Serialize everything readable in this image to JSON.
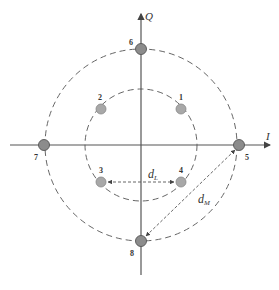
{
  "diagram": {
    "type": "8-QAM star constellation",
    "center": [
      141,
      145
    ],
    "axes": {
      "i_label": "I",
      "q_label": "Q"
    },
    "circles": [
      {
        "name": "inner-ring",
        "radius": 56
      },
      {
        "name": "outer-ring",
        "radius": 96
      }
    ],
    "points": [
      {
        "id": "1",
        "label": "1",
        "x": 181,
        "y": 109,
        "ring": "inner"
      },
      {
        "id": "2",
        "label": "2",
        "x": 101,
        "y": 109,
        "ring": "inner"
      },
      {
        "id": "3",
        "label": "3",
        "x": 101,
        "y": 182,
        "ring": "inner"
      },
      {
        "id": "4",
        "label": "4",
        "x": 181,
        "y": 182,
        "ring": "inner"
      },
      {
        "id": "5",
        "label": "5",
        "x": 239,
        "y": 145,
        "ring": "outer"
      },
      {
        "id": "6",
        "label": "6",
        "x": 141,
        "y": 49,
        "ring": "outer"
      },
      {
        "id": "7",
        "label": "7",
        "x": 44,
        "y": 145,
        "ring": "outer"
      },
      {
        "id": "8",
        "label": "8",
        "x": 141,
        "y": 241,
        "ring": "outer"
      }
    ],
    "distances": [
      {
        "name": "dL",
        "main": "d",
        "sub": "L",
        "from": "3",
        "to": "4"
      },
      {
        "name": "dM",
        "main": "d",
        "sub": "M",
        "from": "5",
        "to": "8"
      }
    ],
    "colors": {
      "inner_point": "#a8a8a8",
      "outer_point": "#8c8c8c",
      "axis": "#555555",
      "dashed": "#555555"
    }
  }
}
